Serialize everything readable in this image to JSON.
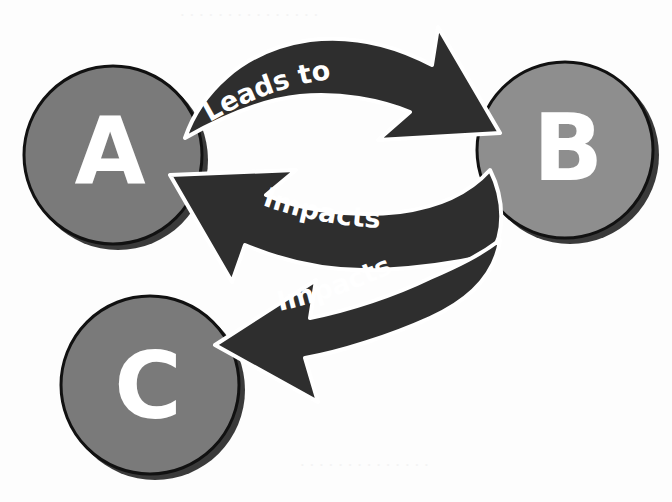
{
  "diagram": {
    "type": "relationship-cycle",
    "colors": {
      "background": "#fdfdfd",
      "node_fill": "#7a7a7a",
      "node_fill_light": "#8e8e8e",
      "node_outline": "#111111",
      "node_shadow": "#3a3a3a",
      "arrow_fill": "#2e2e2e",
      "arrow_outline": "#ffffff",
      "text": "#ffffff"
    },
    "nodes": [
      {
        "id": "A",
        "label": "A"
      },
      {
        "id": "B",
        "label": "B"
      },
      {
        "id": "C",
        "label": "C"
      }
    ],
    "edges": [
      {
        "from": "A",
        "to": "B",
        "label": "Leads to"
      },
      {
        "from": "B",
        "to": "A",
        "label": "Impacts"
      },
      {
        "from": "B",
        "to": "C",
        "label": "Impacts"
      }
    ]
  }
}
